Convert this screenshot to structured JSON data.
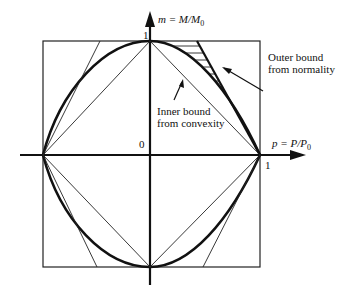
{
  "diagram": {
    "y_axis_label": "m = M/M",
    "y_axis_label_sub": "0",
    "x_axis_label": "p = P/P",
    "x_axis_label_sub": "0",
    "origin_label": "0",
    "y_tick_top": "1",
    "x_tick_right": "1",
    "annotations": {
      "outer": [
        "Outer bound",
        "from normality"
      ],
      "inner": [
        "Inner bound",
        "from convexity"
      ]
    }
  }
}
